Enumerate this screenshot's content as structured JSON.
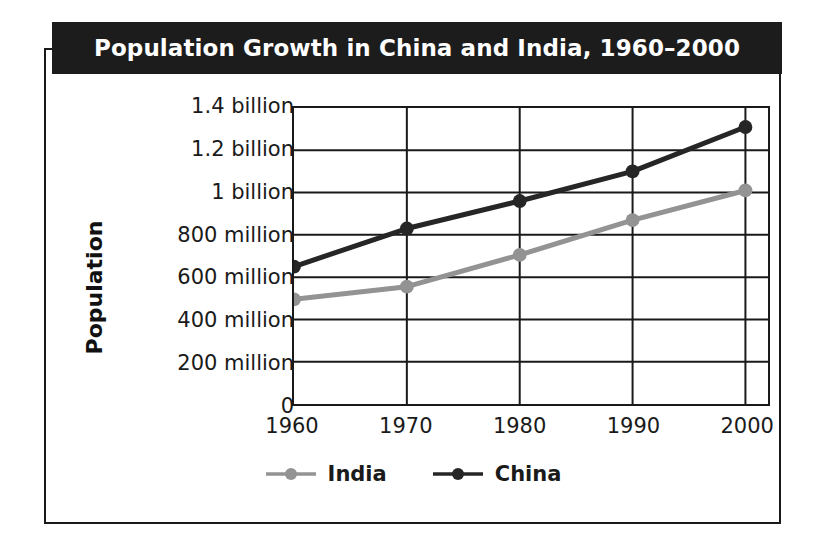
{
  "figure": {
    "title": "Population Growth in China and India, 1960–2000",
    "ylabel": "Population",
    "xlabel": "",
    "colors": {
      "china": "#262626",
      "india": "#939393",
      "banner_bg": "#1c1c1c",
      "banner_text": "#ffffff",
      "frame": "#1a1a1a",
      "grid": "#1a1a1a",
      "background": "#ffffff"
    }
  },
  "legend": {
    "position": "bottom-center",
    "items": [
      {
        "label": "India",
        "color": "#939393",
        "marker": "circle"
      },
      {
        "label": "China",
        "color": "#262626",
        "marker": "circle"
      }
    ]
  },
  "axes": {
    "y_ticks": [
      {
        "value": 1400000000,
        "label": "1.4 billion"
      },
      {
        "value": 1200000000,
        "label": "1.2 billion"
      },
      {
        "value": 1000000000,
        "label": "1 billion"
      },
      {
        "value": 800000000,
        "label": "800 million"
      },
      {
        "value": 600000000,
        "label": "600 million"
      },
      {
        "value": 400000000,
        "label": "400 million"
      },
      {
        "value": 200000000,
        "label": "200 million"
      },
      {
        "value": 0,
        "label": "0"
      }
    ],
    "x_ticks": [
      {
        "value": 1960,
        "label": "1960"
      },
      {
        "value": 1970,
        "label": "1970"
      },
      {
        "value": 1980,
        "label": "1980"
      },
      {
        "value": 1990,
        "label": "1990"
      },
      {
        "value": 2000,
        "label": "2000"
      }
    ]
  },
  "chart_data": {
    "type": "line",
    "title": "Population Growth in China and India, 1960–2000",
    "xlabel": "",
    "ylabel": "Population",
    "x": [
      1960,
      1970,
      1980,
      1990,
      2000
    ],
    "categories": [
      "1960",
      "1970",
      "1980",
      "1990",
      "2000"
    ],
    "xlim": [
      1960,
      2002
    ],
    "ylim": [
      0,
      1400000000
    ],
    "grid": true,
    "legend_position": "bottom-center",
    "y_tick_labels": [
      "0",
      "200 million",
      "400 million",
      "600 million",
      "800 million",
      "1 billion",
      "1.2 billion",
      "1.4 billion"
    ],
    "series": [
      {
        "name": "China",
        "color": "#262626",
        "values": [
          650000000,
          830000000,
          960000000,
          1100000000,
          1310000000
        ],
        "value_labels": [
          "650 million",
          "830 million",
          "960 million",
          "1.1 billion",
          "1.31 billion"
        ]
      },
      {
        "name": "India",
        "color": "#939393",
        "values": [
          495000000,
          555000000,
          705000000,
          870000000,
          1010000000
        ],
        "value_labels": [
          "495 million",
          "555 million",
          "705 million",
          "870 million",
          "1.01 billion"
        ]
      }
    ]
  }
}
